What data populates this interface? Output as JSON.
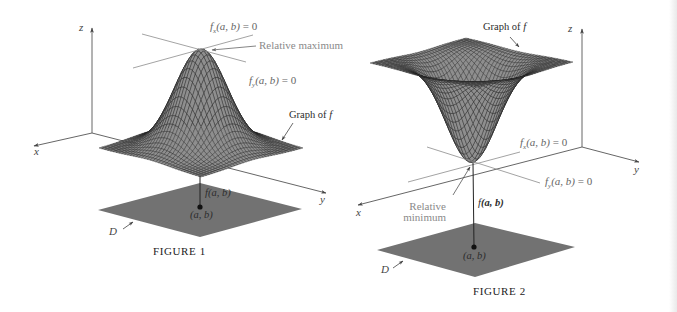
{
  "colors": {
    "surface_fill": "#8e8e8e",
    "mesh_line": "#1e1e1e",
    "domain_fill": "#727272",
    "axis": "#555555",
    "guide_line": "#8c8c8c",
    "annotation_gray": "#8a8a8a"
  },
  "figure1": {
    "caption": "FIGURE 1",
    "axes": {
      "x": "x",
      "y": "y",
      "z": "z"
    },
    "tangent_x": {
      "fn": "f",
      "sub": "x",
      "args": "(a, b)",
      "eq": " = 0"
    },
    "tangent_y": {
      "fn": "f",
      "sub": "y",
      "args": "(a, b)",
      "eq": " = 0"
    },
    "extremum_label": "Relative maximum",
    "graph_label": {
      "prefix": "Graph of ",
      "var": "f"
    },
    "value_label": {
      "fn": "f",
      "args": "(a, b)"
    },
    "point_label": "(a, b)",
    "domain_label": "D"
  },
  "figure2": {
    "caption": "FIGURE 2",
    "axes": {
      "x": "x",
      "y": "y",
      "z": "z"
    },
    "tangent_x": {
      "fn": "f",
      "sub": "x",
      "args": "(a, b)",
      "eq": " = 0"
    },
    "tangent_y": {
      "fn": "f",
      "sub": "y",
      "args": "(a, b)",
      "eq": " = 0"
    },
    "extremum_label": {
      "line1": "Relative",
      "line2": "minimum"
    },
    "graph_label": {
      "prefix": "Graph of ",
      "var": "f"
    },
    "value_label": {
      "fn": "f",
      "args": "(a, b)"
    },
    "point_label": "(a, b)",
    "domain_label": "D"
  }
}
